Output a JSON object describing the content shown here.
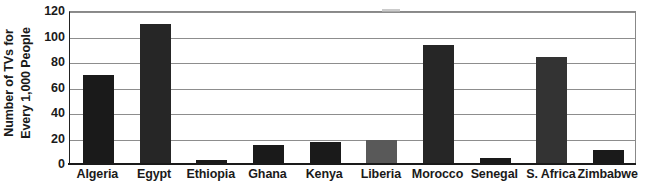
{
  "chart_data": {
    "type": "bar",
    "title": "",
    "xlabel": "",
    "ylabel": "Number of TVs for Every 1,000 People",
    "ylabel_lines": [
      "Number of TVs for",
      "Every 1,000 People"
    ],
    "categories": [
      "Algeria",
      "Egypt",
      "Ethiopia",
      "Ghana",
      "Kenya",
      "Liberia",
      "Morocco",
      "Senegal",
      "S. Africa",
      "Zimbabwe"
    ],
    "values": [
      70,
      110,
      3,
      15,
      17,
      19,
      93,
      5,
      84,
      11
    ],
    "bar_colors": [
      "#1a1a1a",
      "#262626",
      "#1a1a1a",
      "#1a1a1a",
      "#1a1a1a",
      "#595959",
      "#262626",
      "#1a1a1a",
      "#333333",
      "#1a1a1a"
    ],
    "ylim": [
      0,
      120
    ],
    "yticks": [
      0,
      20,
      40,
      60,
      80,
      100,
      120
    ],
    "ytick_labels": [
      "0",
      "20",
      "40",
      "60",
      "80",
      "100",
      "120"
    ],
    "grid": "horizontal",
    "legend": "none",
    "axis_color": "#1a1a1a",
    "gridline_color": "#8d8d8d",
    "background": "#ffffff"
  }
}
